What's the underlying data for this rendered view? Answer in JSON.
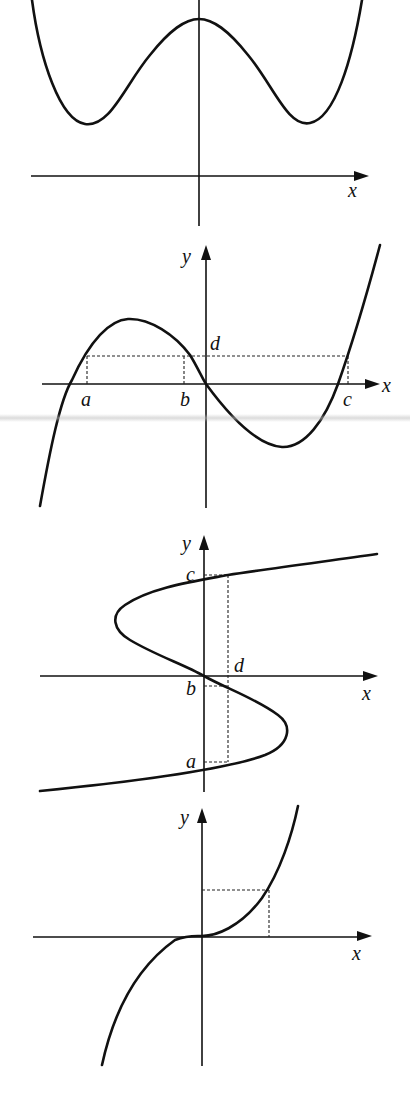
{
  "figures": [
    {
      "id": "quartic-w-shape",
      "description": "Even quartic with two minima and local maximum on y-axis, x-axis below curve",
      "labels": {
        "x": "x"
      }
    },
    {
      "id": "cubic-three-roots",
      "description": "Cubic through origin with horizontal dashed line y=d meeting curve at x=a, b, c",
      "labels": {
        "x": "x",
        "y": "y",
        "a": "a",
        "b": "b",
        "c": "c",
        "d": "d"
      }
    },
    {
      "id": "sideways-cubic",
      "description": "Inverse-cubic S-curve with vertical dashed line x=d meeting curve at y=a, b, c",
      "labels": {
        "x": "x",
        "y": "y",
        "a": "a",
        "b": "b",
        "c": "c",
        "d": "d"
      }
    },
    {
      "id": "cubic-monotone",
      "description": "Increasing cubic y=x^3 with dashed projection lines from a point to both axes",
      "labels": {
        "x": "x",
        "y": "y"
      }
    }
  ],
  "colors": {
    "ink": "#111111",
    "background": "#ffffff"
  }
}
